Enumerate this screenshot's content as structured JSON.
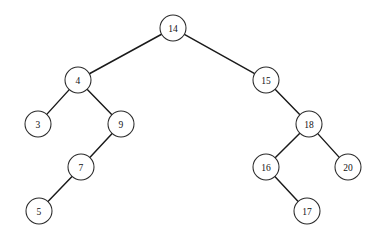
{
  "diagram": {
    "kind": "binary-search-tree",
    "node_radius": 13,
    "colors": {
      "background": "#ffffff",
      "node_fill": "#ffffff",
      "node_stroke": "#2a2a2a",
      "edge_stroke": "#1a1a1a",
      "label_color": "#111111"
    },
    "nodes": [
      {
        "id": "n14",
        "label": "14",
        "x": 173,
        "y": 28
      },
      {
        "id": "n4",
        "label": "4",
        "x": 78,
        "y": 80
      },
      {
        "id": "n15",
        "label": "15",
        "x": 266,
        "y": 80
      },
      {
        "id": "n3",
        "label": "3",
        "x": 38,
        "y": 124
      },
      {
        "id": "n9",
        "label": "9",
        "x": 121,
        "y": 124
      },
      {
        "id": "n18",
        "label": "18",
        "x": 309,
        "y": 124
      },
      {
        "id": "n7",
        "label": "7",
        "x": 81,
        "y": 167
      },
      {
        "id": "n16",
        "label": "16",
        "x": 266,
        "y": 167
      },
      {
        "id": "n20",
        "label": "20",
        "x": 348,
        "y": 167
      },
      {
        "id": "n5",
        "label": "5",
        "x": 39,
        "y": 211
      },
      {
        "id": "n17",
        "label": "17",
        "x": 307,
        "y": 211
      }
    ],
    "edges": [
      {
        "id": "e-14-4",
        "from": "n14",
        "to": "n4",
        "side": "left"
      },
      {
        "id": "e-14-15",
        "from": "n14",
        "to": "n15",
        "side": "right"
      },
      {
        "id": "e-4-3",
        "from": "n4",
        "to": "n3",
        "side": "left"
      },
      {
        "id": "e-4-9",
        "from": "n4",
        "to": "n9",
        "side": "right"
      },
      {
        "id": "e-9-7",
        "from": "n9",
        "to": "n7",
        "side": "left"
      },
      {
        "id": "e-7-5",
        "from": "n7",
        "to": "n5",
        "side": "left"
      },
      {
        "id": "e-15-18",
        "from": "n15",
        "to": "n18",
        "side": "right"
      },
      {
        "id": "e-18-16",
        "from": "n18",
        "to": "n16",
        "side": "left"
      },
      {
        "id": "e-18-20",
        "from": "n18",
        "to": "n20",
        "side": "right"
      },
      {
        "id": "e-16-17",
        "from": "n16",
        "to": "n17",
        "side": "right"
      }
    ]
  }
}
